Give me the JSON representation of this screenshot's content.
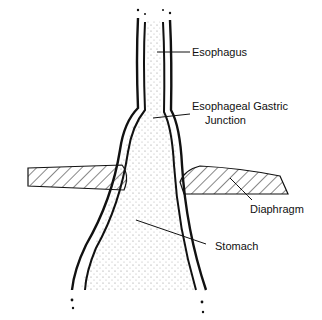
{
  "diagram": {
    "labels": {
      "esophagus": "Esophagus",
      "ej_line1": "Esophageal Gastric",
      "ej_line2": "Junction",
      "diaphragm": "Diaphragm",
      "stomach": "Stomach"
    },
    "colors": {
      "ink": "#111111",
      "background": "#ffffff"
    }
  }
}
